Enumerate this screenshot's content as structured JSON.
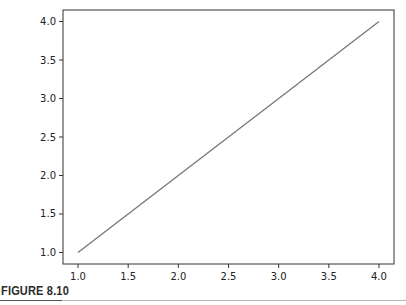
{
  "figure": {
    "caption": "FIGURE 8.10"
  },
  "chart_data": {
    "type": "line",
    "title": "",
    "xlabel": "",
    "ylabel": "",
    "x": [
      1.0,
      2.0,
      3.0,
      4.0
    ],
    "series": [
      {
        "name": "line",
        "values": [
          1.0,
          2.0,
          3.0,
          4.0
        ],
        "color": "#777777"
      }
    ],
    "x_ticks": [
      "1.0",
      "1.5",
      "2.0",
      "2.5",
      "3.0",
      "3.5",
      "4.0"
    ],
    "y_ticks": [
      "1.0",
      "1.5",
      "2.0",
      "2.5",
      "3.0",
      "3.5",
      "4.0"
    ],
    "xlim": [
      0.85,
      4.15
    ],
    "ylim": [
      0.85,
      4.15
    ],
    "grid": false,
    "legend": null
  }
}
